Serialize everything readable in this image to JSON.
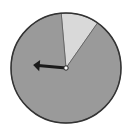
{
  "spinner": {
    "title": "",
    "sections": [
      {
        "name": "light-section",
        "start_deg": -5,
        "end_deg": 35,
        "color": "#d9d9d9"
      },
      {
        "name": "dark-section",
        "start_deg": 35,
        "end_deg": 355,
        "color": "#9a9a9a"
      }
    ],
    "arrow": {
      "direction_deg": 275,
      "color": "#1a1a1a"
    },
    "outline_color": "#333333",
    "hub_color": "#ffffff"
  }
}
